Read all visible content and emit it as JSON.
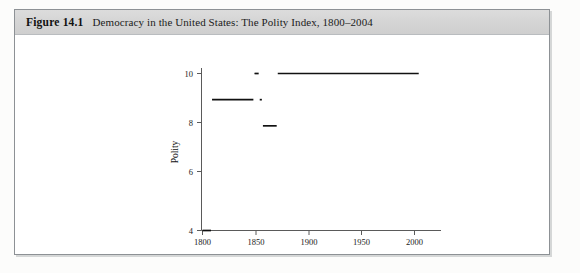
{
  "figure": {
    "label": "Figure 14.1",
    "title": "Democracy in the United States: The Polity Index, 1800–2004"
  },
  "chart_data": {
    "type": "line",
    "title": "Democracy in the United States: The Polity Index, 1800–2004",
    "xlabel": "Year",
    "ylabel": "Polity",
    "xlim": [
      1795,
      2010
    ],
    "ylim": [
      3.2,
      10.6
    ],
    "xticks": [
      1800,
      1850,
      1900,
      1950,
      2000
    ],
    "xtick_labels": [
      "1800",
      "1850",
      "1900",
      "1950",
      "2000"
    ],
    "yticks": [
      4,
      6,
      8,
      10
    ],
    "ytick_labels": [
      "4",
      "6",
      "8",
      "10"
    ],
    "grid": false,
    "legend": null,
    "series": [
      {
        "name": "Polity Index",
        "segments": [
          {
            "x_start": 1800,
            "x_end": 1808,
            "y": 4
          },
          {
            "x_start": 1809,
            "x_end": 1848,
            "y": 9
          },
          {
            "x_start": 1849,
            "x_end": 1853,
            "y": 10
          },
          {
            "x_start": 1854,
            "x_end": 1856,
            "y": 9
          },
          {
            "x_start": 1857,
            "x_end": 1870,
            "y": 8
          },
          {
            "x_start": 1871,
            "x_end": 2004,
            "y": 10
          }
        ]
      }
    ]
  },
  "colors": {
    "header_band": "#d6d6d6",
    "border": "#8d9195",
    "data_line": "#111111",
    "axis": "#5a5a5a",
    "plot_background": "#ffffff"
  }
}
